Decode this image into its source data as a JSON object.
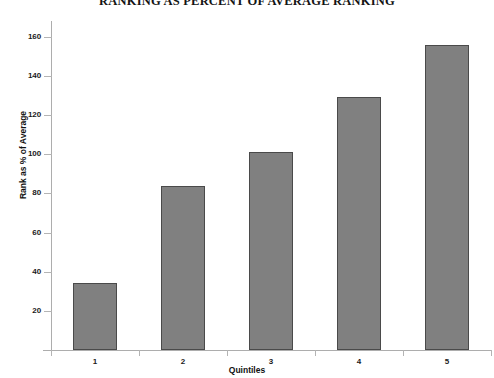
{
  "chart_data": {
    "type": "bar",
    "title": "RANKING AS PERCENT OF AVERAGE RANKING",
    "xlabel": "Quintiles",
    "ylabel": "Rank as % of Average",
    "categories": [
      "1",
      "2",
      "3",
      "4",
      "5"
    ],
    "values": [
      34,
      84,
      101,
      129,
      156
    ],
    "ylim": [
      0,
      168
    ],
    "yticks": [
      20,
      40,
      60,
      80,
      100,
      120,
      140,
      160
    ],
    "ytick_labels": [
      "20",
      "40",
      "60",
      "80",
      "100",
      "120",
      "140",
      "160"
    ],
    "grid": false,
    "legend": "none",
    "bar_color": "#808080",
    "bar_border_color": "#4a4a4a",
    "axis_color": "#adadad",
    "background_color": "#ffffff",
    "text_color": "#111111"
  }
}
